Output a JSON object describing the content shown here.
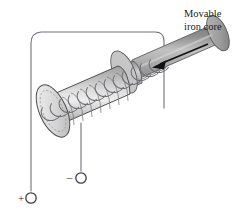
{
  "figure": {
    "name": "solenoid-with-movable-iron-core",
    "background_color": "#ffffff",
    "width": 241,
    "height": 215
  },
  "labels": {
    "core_label_line1": "Movable",
    "core_label_line2": "iron core",
    "positive_terminal_sign": "+",
    "negative_terminal_sign": "–"
  },
  "colors": {
    "wire": "#6e6e72",
    "outline": "#4a4a4a",
    "coil_stroke": "#8a8a8e",
    "cylinder_light": "#f2f2f2",
    "cylinder_mid": "#c9c9c9",
    "cylinder_dark": "#9a9a9a",
    "core_light": "#d8d8d8",
    "core_mid": "#a9a9a9",
    "core_dark": "#6f6f6f",
    "arrow": "#111111",
    "text": "#1b1b1b",
    "terminal_ring": "#4a4a4a"
  },
  "parts": {
    "solenoid_body": "solenoid-cylinder",
    "coil": "helical-wire-coil",
    "iron_core": "movable-iron-core-rod",
    "motion_arrow": "core-motion-arrow-left",
    "positive_lead": "positive-wire-lead",
    "negative_lead": "negative-wire-lead",
    "positive_terminal": "positive-terminal-node",
    "negative_terminal": "negative-terminal-node"
  },
  "geometry": {
    "coil_turns": 13,
    "arrow_direction": "left",
    "positive_terminal_xy": [
      31,
      198
    ],
    "negative_terminal_xy": [
      81,
      178
    ]
  }
}
